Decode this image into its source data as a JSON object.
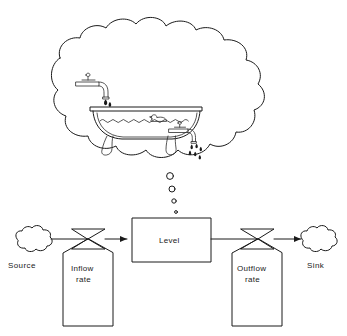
{
  "diagram": {
    "type": "system-dynamics-stock-and-flow",
    "background_color": "#ffffff",
    "line_color": "#1a1a1a"
  },
  "thought_bubble": {
    "name": "thought-cloud",
    "tail_dots": 4,
    "contents": {
      "bathtub": "clawfoot-bathtub",
      "inlet_faucet": "wall-faucet-top-left",
      "outlet_faucet": "drain-faucet-lower-right",
      "water": "wavy-water-surface",
      "toy": "rubber-duck",
      "inlet_drops": 2,
      "outlet_drops": 6
    }
  },
  "flow_diagram": {
    "source": {
      "label": "Source",
      "shape": "cloud"
    },
    "inflow": {
      "label_line1": "Inflow",
      "label_line2": "rate",
      "shape": "valve"
    },
    "stock": {
      "label": "Level",
      "shape": "rectangle"
    },
    "outflow": {
      "label_line1": "Outflow",
      "label_line2": "rate",
      "shape": "valve"
    },
    "sink": {
      "label": "Sink",
      "shape": "cloud"
    },
    "arrow_direction": "left-to-right"
  }
}
